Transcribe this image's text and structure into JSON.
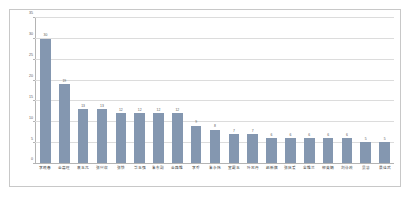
{
  "chart_data": {
    "type": "bar",
    "title": "",
    "subtitle": "",
    "xlabel": "",
    "ylabel": "",
    "ylim": [
      0,
      35
    ],
    "yticks": [
      0,
      5,
      10,
      15,
      20,
      25,
      30,
      35
    ],
    "grid": true,
    "legend": false,
    "legend_position": "none",
    "bar_color": "#8497B0",
    "grid_color": "#DCDCDC",
    "axis_color": "#B4B4B4",
    "text_color": "#595959",
    "border_color": "#C8C8C8",
    "show_value_labels": true,
    "categories": [
      "李晓春",
      "金嘉旺",
      "袁玉兀",
      "张兴収",
      "张铁",
      "毕玉强",
      "朱东副",
      "金路维",
      "李乔",
      "朱永炜",
      "宣霞玉",
      "叶忠丹",
      "赵新旗",
      "张庆爱",
      "全维兰",
      "柳英娟",
      "刘泳政",
      "吴慧",
      "景佳武"
    ],
    "values": [
      30,
      19,
      13,
      13,
      12,
      12,
      12,
      12,
      9,
      8,
      7,
      7,
      6,
      6,
      6,
      6,
      6,
      5,
      5
    ],
    "value_labels": [
      "30",
      "19",
      "13",
      "13",
      "12",
      "12",
      "12",
      "12",
      "9",
      "8",
      "7",
      "7",
      "6",
      "6",
      "6",
      "6",
      "6",
      "5",
      "5"
    ]
  }
}
